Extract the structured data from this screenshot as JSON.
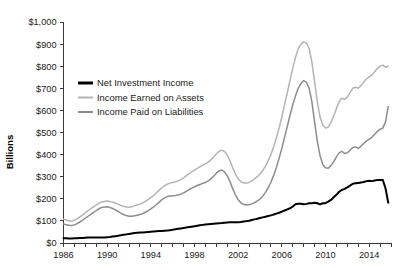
{
  "chart_data": {
    "type": "line",
    "title": "",
    "xlabel": "",
    "ylabel": "Billions",
    "xlim": [
      1986,
      2016
    ],
    "ylim": [
      0,
      1000
    ],
    "grid": false,
    "legend_position": "upper-left-inside",
    "y_ticks": [
      0,
      100,
      200,
      300,
      400,
      500,
      600,
      700,
      800,
      900,
      1000
    ],
    "y_tick_labels": [
      "$0",
      "$100",
      "$200",
      "$300",
      "$400",
      "$500",
      "$600",
      "$700",
      "$800",
      "$900",
      "$1,000"
    ],
    "x_ticks": [
      1986,
      1987,
      1988,
      1989,
      1990,
      1991,
      1992,
      1993,
      1994,
      1995,
      1996,
      1997,
      1998,
      1999,
      2000,
      2001,
      2002,
      2003,
      2004,
      2005,
      2006,
      2007,
      2008,
      2009,
      2010,
      2011,
      2012,
      2013,
      2014,
      2015,
      2016
    ],
    "x_tick_labels": [
      "1986",
      "1990",
      "1994",
      "1998",
      "2002",
      "2006",
      "2010",
      "2014"
    ],
    "x_labeled_ticks": [
      1986,
      1990,
      1994,
      1998,
      2002,
      2006,
      2010,
      2014
    ],
    "colors": {
      "net_investment_income": "#000000",
      "income_earned_on_assets": "#b4b4b4",
      "income_paid_on_liabilities": "#8c8c8c"
    },
    "x": [
      1986.0,
      1986.25,
      1986.5,
      1986.75,
      1987.0,
      1987.25,
      1987.5,
      1987.75,
      1988.0,
      1988.25,
      1988.5,
      1988.75,
      1989.0,
      1989.25,
      1989.5,
      1989.75,
      1990.0,
      1990.25,
      1990.5,
      1990.75,
      1991.0,
      1991.25,
      1991.5,
      1991.75,
      1992.0,
      1992.25,
      1992.5,
      1992.75,
      1993.0,
      1993.25,
      1993.5,
      1993.75,
      1994.0,
      1994.25,
      1994.5,
      1994.75,
      1995.0,
      1995.25,
      1995.5,
      1995.75,
      1996.0,
      1996.25,
      1996.5,
      1996.75,
      1997.0,
      1997.25,
      1997.5,
      1997.75,
      1998.0,
      1998.25,
      1998.5,
      1998.75,
      1999.0,
      1999.25,
      1999.5,
      1999.75,
      2000.0,
      2000.25,
      2000.5,
      2000.75,
      2001.0,
      2001.25,
      2001.5,
      2001.75,
      2002.0,
      2002.25,
      2002.5,
      2002.75,
      2003.0,
      2003.25,
      2003.5,
      2003.75,
      2004.0,
      2004.25,
      2004.5,
      2004.75,
      2005.0,
      2005.25,
      2005.5,
      2005.75,
      2006.0,
      2006.25,
      2006.5,
      2006.75,
      2007.0,
      2007.25,
      2007.5,
      2007.75,
      2008.0,
      2008.25,
      2008.5,
      2008.75,
      2009.0,
      2009.25,
      2009.5,
      2009.75,
      2010.0,
      2010.25,
      2010.5,
      2010.75,
      2011.0,
      2011.25,
      2011.5,
      2011.75,
      2012.0,
      2012.25,
      2012.5,
      2012.75,
      2013.0,
      2013.25,
      2013.5,
      2013.75,
      2014.0,
      2014.25,
      2014.5,
      2014.75,
      2015.0,
      2015.25,
      2015.5,
      2015.75
    ],
    "series": [
      {
        "name": "Income Earned on Assets",
        "color": "#b4b4b4",
        "values": [
          108,
          104,
          100,
          99,
          103,
          110,
          118,
          126,
          137,
          146,
          155,
          163,
          172,
          180,
          186,
          188,
          190,
          188,
          185,
          181,
          176,
          170,
          166,
          163,
          162,
          164,
          168,
          172,
          176,
          181,
          188,
          196,
          205,
          215,
          226,
          238,
          250,
          259,
          266,
          271,
          274,
          277,
          281,
          287,
          295,
          304,
          314,
          322,
          330,
          338,
          345,
          352,
          358,
          366,
          376,
          389,
          404,
          415,
          420,
          414,
          398,
          372,
          340,
          312,
          290,
          277,
          272,
          271,
          274,
          281,
          290,
          300,
          312,
          328,
          348,
          372,
          400,
          435,
          475,
          520,
          570,
          625,
          680,
          735,
          790,
          840,
          878,
          900,
          910,
          905,
          880,
          820,
          730,
          640,
          570,
          535,
          520,
          525,
          545,
          575,
          608,
          640,
          655,
          650,
          660,
          680,
          700,
          705,
          700,
          712,
          728,
          742,
          752,
          760,
          775,
          790,
          800,
          805,
          795,
          800
        ]
      },
      {
        "name": "Income Paid on Liabilities",
        "color": "#8c8c8c",
        "values": [
          86,
          83,
          80,
          79,
          82,
          88,
          95,
          103,
          113,
          121,
          130,
          138,
          147,
          155,
          161,
          163,
          164,
          161,
          156,
          150,
          143,
          135,
          129,
          124,
          121,
          121,
          123,
          126,
          129,
          133,
          139,
          146,
          154,
          163,
          173,
          184,
          196,
          204,
          210,
          213,
          214,
          215,
          217,
          221,
          227,
          234,
          242,
          248,
          254,
          260,
          265,
          270,
          274,
          281,
          290,
          302,
          316,
          326,
          330,
          322,
          305,
          278,
          246,
          218,
          196,
          182,
          175,
          172,
          173,
          177,
          183,
          190,
          199,
          212,
          229,
          250,
          275,
          306,
          342,
          383,
          428,
          478,
          528,
          578,
          625,
          665,
          700,
          722,
          735,
          728,
          700,
          640,
          548,
          460,
          395,
          355,
          340,
          338,
          350,
          368,
          390,
          408,
          415,
          405,
          408,
          420,
          432,
          435,
          428,
          438,
          450,
          462,
          470,
          478,
          492,
          505,
          515,
          520,
          548,
          618
        ]
      },
      {
        "name": "Net Investment Income",
        "color": "#000000",
        "values": [
          22,
          21,
          20,
          20,
          21,
          22,
          23,
          23,
          24,
          25,
          25,
          25,
          25,
          25,
          25,
          25,
          26,
          27,
          29,
          31,
          33,
          35,
          37,
          39,
          41,
          43,
          45,
          46,
          47,
          48,
          49,
          50,
          51,
          52,
          53,
          54,
          54,
          55,
          56,
          58,
          60,
          62,
          64,
          66,
          68,
          70,
          72,
          74,
          76,
          78,
          80,
          82,
          84,
          85,
          86,
          87,
          88,
          89,
          90,
          92,
          93,
          94,
          94,
          94,
          94,
          95,
          97,
          99,
          101,
          104,
          107,
          110,
          113,
          116,
          119,
          122,
          125,
          129,
          133,
          137,
          142,
          147,
          152,
          157,
          165,
          175,
          178,
          178,
          175,
          177,
          180,
          180,
          182,
          180,
          175,
          180,
          180,
          187,
          195,
          207,
          218,
          232,
          240,
          245,
          252,
          260,
          268,
          270,
          272,
          274,
          276,
          280,
          282,
          280,
          283,
          285,
          285,
          285,
          247,
          182
        ]
      }
    ]
  },
  "legend": {
    "items": [
      {
        "label": "Net Investment Income",
        "color": "#000000"
      },
      {
        "label": "Income Earned on Assets",
        "color": "#b4b4b4"
      },
      {
        "label": "Income Paid on Liabilities",
        "color": "#8c8c8c"
      }
    ]
  },
  "axis": {
    "y_title": "Billions"
  }
}
